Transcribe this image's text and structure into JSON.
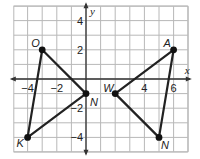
{
  "graph": {
    "x_axis_label": "x",
    "y_axis_label": "y",
    "x_range": [
      -5,
      7
    ],
    "y_range": [
      -5,
      5
    ],
    "x_tick_labels": [
      {
        "value": -4,
        "text": "−4"
      },
      {
        "value": -2,
        "text": "−2"
      },
      {
        "value": 4,
        "text": "4"
      },
      {
        "value": 6,
        "text": "6"
      }
    ],
    "y_tick_labels": [
      {
        "value": 4,
        "text": "4"
      },
      {
        "value": 2,
        "text": "2"
      },
      {
        "value": -2,
        "text": "−2"
      },
      {
        "value": -4,
        "text": "−4"
      }
    ],
    "colors": {
      "grid": "#b8b8b8",
      "axis": "#333333",
      "segment": "#222222",
      "point": "#111111"
    }
  },
  "figures": [
    {
      "name": "triangle-left",
      "vertices": [
        {
          "label": "O",
          "x": -3,
          "y": 2
        },
        {
          "label": "N",
          "x": 0,
          "y": -1
        },
        {
          "label": "K",
          "x": -4,
          "y": -4
        }
      ]
    },
    {
      "name": "triangle-right",
      "vertices": [
        {
          "label": "A",
          "x": 6,
          "y": 2
        },
        {
          "label": "W",
          "x": 2,
          "y": -1
        },
        {
          "label": "N",
          "x": 5,
          "y": -4
        }
      ]
    }
  ]
}
